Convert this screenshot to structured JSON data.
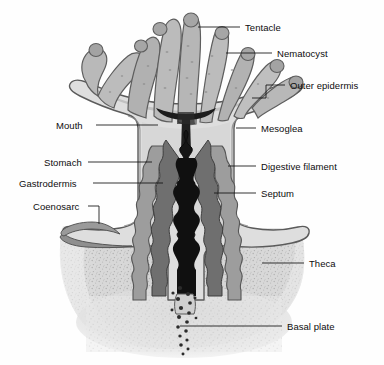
{
  "figure": {
    "domain": "Diagram",
    "width": 384,
    "height": 365,
    "background_color": "#fefefe",
    "line_color": "#111111",
    "label_font_size_px": 9.5
  },
  "labels": {
    "tentacle": "Tentacle",
    "nematocyst": "Nematocyst",
    "outer_epidermis": "Outer epidermis",
    "mesoglea": "Mesoglea",
    "digestive_filament": "Digestive filament",
    "septum": "Septum",
    "theca": "Theca",
    "basal_plate": "Basal plate",
    "mouth": "Mouth",
    "stomach": "Stomach",
    "gastrodermis": "Gastrodermis",
    "coenosarc": "Coenosarc"
  },
  "callouts": [
    {
      "key": "tentacle",
      "side": "right",
      "text_x": 245,
      "text_y": 23,
      "line": "M198,27 L240,27"
    },
    {
      "key": "nematocyst",
      "side": "right",
      "text_x": 277,
      "text_y": 49,
      "line": "M226,53 L272,53"
    },
    {
      "key": "outer_epidermis",
      "side": "right",
      "text_x": 290,
      "text_y": 81,
      "line": "M252,98 L266,98 L266,85 L285,85"
    },
    {
      "key": "mesoglea",
      "side": "right",
      "text_x": 261,
      "text_y": 124,
      "line": "M236,128 L256,128"
    },
    {
      "key": "digestive_filament",
      "side": "right",
      "text_x": 261,
      "text_y": 162,
      "line": "M228,166 L256,166"
    },
    {
      "key": "septum",
      "side": "right",
      "text_x": 261,
      "text_y": 189,
      "line": "M214,193 L256,193"
    },
    {
      "key": "theca",
      "side": "right",
      "text_x": 309,
      "text_y": 259,
      "line": "M262,263 L304,263"
    },
    {
      "key": "basal_plate",
      "side": "right",
      "text_x": 287,
      "text_y": 322,
      "line": "M180,326 L282,326"
    },
    {
      "key": "mouth",
      "side": "left",
      "text_x": 56,
      "text_y": 121,
      "line": "M96,125 L158,125"
    },
    {
      "key": "stomach",
      "side": "left",
      "text_x": 44,
      "text_y": 158,
      "line": "M88,162 L152,162"
    },
    {
      "key": "gastrodermis",
      "side": "left",
      "text_x": 19,
      "text_y": 179,
      "line": "M93,183 L163,183"
    },
    {
      "key": "coenosarc",
      "side": "left",
      "text_x": 33,
      "text_y": 202,
      "line": "M88,206 L99,206 L99,224"
    }
  ],
  "anatomy_parts": [
    {
      "name": "tentacle-crown",
      "description": "Eight club-shaped tentacles radiating from the oral disc"
    },
    {
      "name": "oral-disc",
      "description": "Flared oral disc at the top of the column"
    },
    {
      "name": "mouth-opening",
      "description": "Dark slit at the centre of the oral disc"
    },
    {
      "name": "body-column",
      "description": "Cylindrical column wall of the polyp"
    },
    {
      "name": "gastric-cavity",
      "description": "Dark wavy central gastrovascular cavity"
    },
    {
      "name": "septa",
      "description": "Paired wavy mesenterial septa flanking the cavity"
    },
    {
      "name": "theca-skeleton",
      "description": "Stippled calcareous cup surrounding the lower polyp"
    },
    {
      "name": "basal-plate-zone",
      "description": "Speckled basal plate deposit beneath the polyp"
    },
    {
      "name": "coenosarc-tissue",
      "description": "Tissue sheet extending laterally from the column rim"
    }
  ],
  "colors": {
    "tentacle_fill": "#b4b4b4",
    "tentacle_fill_light": "#c8c8c8",
    "column_fill": "#dcdcdc",
    "mesoglea_fill": "#c6c6c6",
    "septum_fill": "#8e8e8e",
    "septum_dark": "#5a5a5a",
    "cavity_fill": "#171717",
    "theca_fill": "#c4c4c4",
    "outline": "#4a4a4a",
    "label_color": "#0d0d0d"
  }
}
